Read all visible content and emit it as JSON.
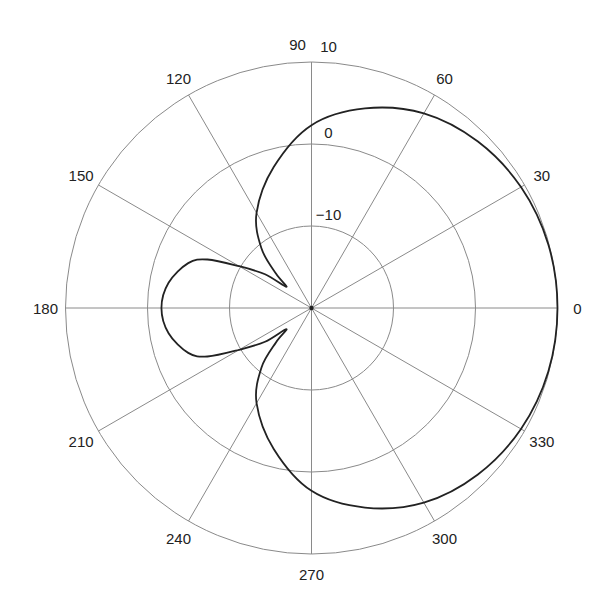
{
  "chart_data": {
    "type": "polar",
    "title": "",
    "angle_unit": "degrees",
    "angle_ticks": [
      0,
      30,
      60,
      90,
      120,
      150,
      180,
      210,
      240,
      270,
      300,
      330
    ],
    "angle_labels": [
      "0",
      "30",
      "60",
      "90",
      "120",
      "150",
      "180",
      "210",
      "240",
      "270",
      "300",
      "330"
    ],
    "radial_ticks": [
      -10,
      0,
      10
    ],
    "radial_labels": [
      "−10",
      "0",
      "10"
    ],
    "radial_unit": "dB",
    "rlim": [
      -20,
      10
    ],
    "grid": true,
    "series": [
      {
        "name": "pattern",
        "color": "#222222",
        "theta": [
          0,
          15,
          30,
          45,
          60,
          75,
          90,
          105,
          120,
          130,
          136,
          140,
          144,
          150,
          155,
          160,
          170,
          180,
          190,
          200,
          205,
          210,
          216,
          220,
          224,
          230,
          240,
          255,
          270,
          285,
          300,
          315,
          330,
          345,
          360
        ],
        "r_db": [
          10,
          9.9,
          9.5,
          8.7,
          7.4,
          5.2,
          2.3,
          -2.2,
          -6.6,
          -10.5,
          -14,
          -16,
          -13,
          -9.8,
          -6,
          -4,
          -2.3,
          -1.7,
          -2.3,
          -4,
          -6,
          -9.8,
          -13,
          -16,
          -14,
          -10.5,
          -6.6,
          -2.2,
          2.3,
          5.2,
          7.4,
          8.7,
          9.5,
          9.9,
          10
        ]
      }
    ]
  },
  "colors": {
    "grid": "#8a8a8a",
    "curve": "#222222",
    "background": "#ffffff"
  }
}
